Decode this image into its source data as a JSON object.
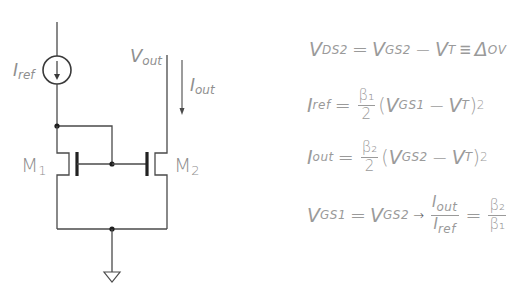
{
  "circuit": {
    "title": "NMOS current mirror",
    "labels": {
      "iref": {
        "main": "I",
        "sub": "ref"
      },
      "vout": {
        "main": "V",
        "sub": "out"
      },
      "iout": {
        "main": "I",
        "sub": "out"
      },
      "m1": {
        "main": "M",
        "sub": "1"
      },
      "m2": {
        "main": "M",
        "sub": "2"
      }
    },
    "colors": {
      "wire": "#4a4a4a",
      "label": "#8f8f8f",
      "node": "#1e1e1e"
    }
  },
  "equations": [
    {
      "id": "vds2",
      "parts": {
        "a": "V",
        "a_sub": "DS2",
        "eq": "=",
        "b": "V",
        "b_sub": "GS2",
        "minus": "−",
        "c": "V",
        "c_sub": "T",
        "equiv": "≡",
        "d": "Δ",
        "d_sub": "OV"
      }
    },
    {
      "id": "iref",
      "parts": {
        "lhs": "I",
        "lhs_sub": "ref",
        "eq": "=",
        "num": "β₁",
        "den": "2",
        "open": "(",
        "v1": "V",
        "v1_sub": "GS1",
        "minus": "−",
        "v2": "V",
        "v2_sub": "T",
        "close": ")",
        "pow": "2"
      }
    },
    {
      "id": "iout",
      "parts": {
        "lhs": "I",
        "lhs_sub": "out",
        "eq": "=",
        "num": "β₂",
        "den": "2",
        "open": "(",
        "v1": "V",
        "v1_sub": "GS2",
        "minus": "−",
        "v2": "V",
        "v2_sub": "T",
        "close": ")",
        "pow": "2"
      }
    },
    {
      "id": "ratio",
      "parts": {
        "a": "V",
        "a_sub": "GS1",
        "eq": "=",
        "b": "V",
        "b_sub": "GS2",
        "arrow": "→",
        "num1": "I",
        "num1_sub": "out",
        "den1": "I",
        "den1_sub": "ref",
        "eq2": "=",
        "num2": "β₂",
        "den2": "β₁"
      }
    }
  ]
}
